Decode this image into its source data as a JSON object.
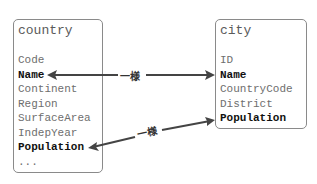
{
  "diagram": {
    "tables": [
      {
        "name": "country",
        "fields": [
          {
            "label": "Code",
            "highlighted": false
          },
          {
            "label": "Name",
            "highlighted": true
          },
          {
            "label": "Continent",
            "highlighted": false
          },
          {
            "label": "Region",
            "highlighted": false
          },
          {
            "label": "SurfaceArea",
            "highlighted": false
          },
          {
            "label": "IndepYear",
            "highlighted": false
          },
          {
            "label": "Population",
            "highlighted": true
          },
          {
            "label": "...",
            "highlighted": false
          }
        ]
      },
      {
        "name": "city",
        "fields": [
          {
            "label": "ID",
            "highlighted": false
          },
          {
            "label": "Name",
            "highlighted": true
          },
          {
            "label": "CountryCode",
            "highlighted": false
          },
          {
            "label": "District",
            "highlighted": false
          },
          {
            "label": "Population",
            "highlighted": true
          }
        ]
      }
    ],
    "relations": [
      {
        "from": "country.Name",
        "to": "city.Name",
        "label": "一様",
        "direction": "both"
      },
      {
        "from": "country.Population",
        "to": "city.Population",
        "label": "一様",
        "direction": "both"
      }
    ],
    "colors": {
      "box_border": "#8a8a8a",
      "field_text": "#6e6e6e",
      "key_text": "#111111",
      "arrow": "#444444"
    }
  }
}
